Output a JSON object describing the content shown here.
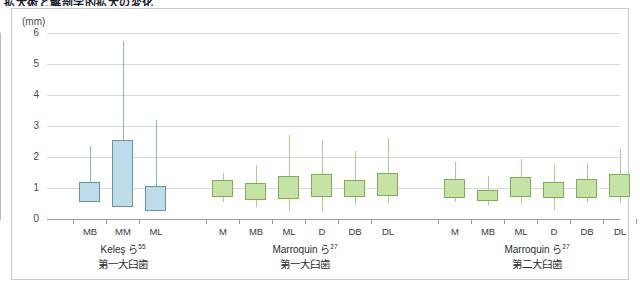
{
  "page": {
    "title": "拡大術と解剖学的拡大の変化"
  },
  "chart_data": {
    "type": "box",
    "title": "拡大術と解剖学的拡大の変化",
    "ylabel": "(mm)",
    "xlabel": "",
    "ylim": [
      0,
      6
    ],
    "yticks": [
      0,
      1,
      2,
      3,
      4,
      5,
      6
    ],
    "ytick_labels": [
      "0",
      "1",
      "2",
      "3",
      "4",
      "5",
      "6"
    ],
    "grid": true,
    "legend": "none",
    "groups": [
      {
        "name": "Keleş ら",
        "reference": "55",
        "subtitle": "第一大臼歯",
        "color": "#bddbe8",
        "edge_color": "#6b93a8",
        "boxes": [
          {
            "label": "MB",
            "whisker_low": 0.55,
            "q1": 0.55,
            "median": 1.2,
            "q3": 1.2,
            "whisker_high": 2.35
          },
          {
            "label": "MM",
            "whisker_low": 0.4,
            "q1": 0.4,
            "median": 2.55,
            "q3": 2.55,
            "whisker_high": 5.75
          },
          {
            "label": "ML",
            "whisker_low": 0.25,
            "q1": 0.25,
            "median": 1.05,
            "q3": 1.05,
            "whisker_high": 3.2
          }
        ]
      },
      {
        "name": "Marroquin ら",
        "reference": "27",
        "subtitle": "第一大臼歯",
        "color": "#c5e3a5",
        "edge_color": "#7db04f",
        "boxes": [
          {
            "label": "M",
            "whisker_low": 0.55,
            "q1": 0.7,
            "median": 1.0,
            "q3": 1.25,
            "whisker_high": 1.5
          },
          {
            "label": "MB",
            "whisker_low": 0.4,
            "q1": 0.6,
            "median": 0.9,
            "q3": 1.15,
            "whisker_high": 1.75
          },
          {
            "label": "ML",
            "whisker_low": 0.25,
            "q1": 0.65,
            "median": 1.1,
            "q3": 1.4,
            "whisker_high": 2.7
          },
          {
            "label": "D",
            "whisker_low": 0.25,
            "q1": 0.7,
            "median": 1.15,
            "q3": 1.45,
            "whisker_high": 2.55
          },
          {
            "label": "DB",
            "whisker_low": 0.45,
            "q1": 0.7,
            "median": 1.0,
            "q3": 1.25,
            "whisker_high": 2.2
          },
          {
            "label": "DL",
            "whisker_low": 0.5,
            "q1": 0.75,
            "median": 1.2,
            "q3": 1.5,
            "whisker_high": 2.6
          }
        ]
      },
      {
        "name": "Marroquin ら",
        "reference": "27",
        "subtitle": "第二大臼歯",
        "color": "#c5e3a5",
        "edge_color": "#7db04f",
        "boxes": [
          {
            "label": "M",
            "whisker_low": 0.55,
            "q1": 0.7,
            "median": 1.05,
            "q3": 1.3,
            "whisker_high": 1.85
          },
          {
            "label": "MB",
            "whisker_low": 0.45,
            "q1": 0.6,
            "median": 0.8,
            "q3": 0.95,
            "whisker_high": 1.4
          },
          {
            "label": "ML",
            "whisker_low": 0.5,
            "q1": 0.7,
            "median": 1.1,
            "q3": 1.35,
            "whisker_high": 1.95
          },
          {
            "label": "D",
            "whisker_low": 0.3,
            "q1": 0.7,
            "median": 1.0,
            "q3": 1.2,
            "whisker_high": 1.75
          },
          {
            "label": "DB",
            "whisker_low": 0.55,
            "q1": 0.7,
            "median": 1.1,
            "q3": 1.3,
            "whisker_high": 1.8
          },
          {
            "label": "DL",
            "whisker_low": 0.5,
            "q1": 0.7,
            "median": 1.2,
            "q3": 1.45,
            "whisker_high": 2.25
          }
        ]
      }
    ]
  }
}
